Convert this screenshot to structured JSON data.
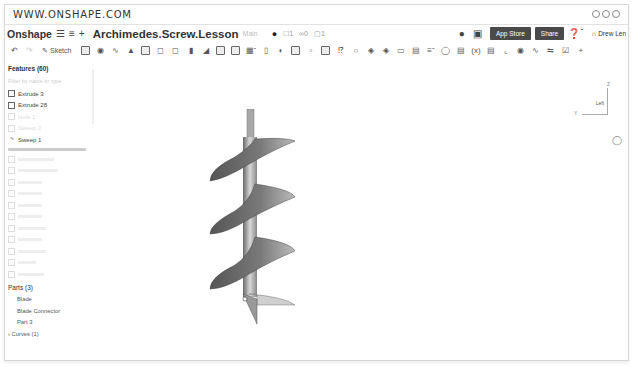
{
  "browser": {
    "url": "WWW.ONSHAPE.COM"
  },
  "app_bar": {
    "brand": "Onshape",
    "menu_icon": "hamburger-icon",
    "doc_title": "Archimedes.Screw.Lesson",
    "branch": "Main",
    "likes": "1",
    "links": "0",
    "copies": "1",
    "app_store_label": "App Store",
    "share_label": "Share",
    "user_name": "Drew Len"
  },
  "toolbar": {
    "sketch_label": "Sketch"
  },
  "sidebar": {
    "features_title": "Features (60)",
    "filter_placeholder": "Filter by name or type",
    "active_features": [
      {
        "label": "Extrude 3"
      },
      {
        "label": "Extrude 28"
      },
      {
        "label": "Hole 1",
        "faded": true
      },
      {
        "label": "Sweep 2",
        "faded": true
      },
      {
        "label": "Sweep 1"
      }
    ],
    "rolled_back_count": 11,
    "parts_title": "Parts (3)",
    "parts": [
      "Blade",
      "Blade Connector",
      "Part 3"
    ],
    "curves_label": "Curves (1)"
  },
  "view_cube": {
    "face_label": "Left",
    "axis_z": "Z",
    "axis_y": "Y"
  },
  "colors": {
    "button_dark": "#4a4a4a",
    "model_gray": "#7a7a7a"
  }
}
